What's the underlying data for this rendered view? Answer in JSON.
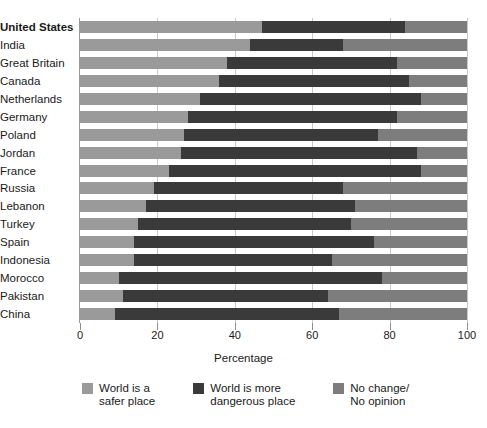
{
  "chart_data": {
    "type": "bar",
    "subtype": "horizontal-stacked-100",
    "title": "",
    "xlabel": "Percentage",
    "ylabel": "",
    "xlim": [
      0,
      100
    ],
    "xticks": [
      0,
      20,
      40,
      60,
      80,
      100
    ],
    "grid": true,
    "legend_position": "bottom-left",
    "categories": [
      "United States",
      "India",
      "Great Britain",
      "Canada",
      "Netherlands",
      "Germany",
      "Poland",
      "Jordan",
      "France",
      "Russia",
      "Lebanon",
      "Turkey",
      "Spain",
      "Indonesia",
      "Morocco",
      "Pakistan",
      "China"
    ],
    "emphasized_category": "United States",
    "series": [
      {
        "name": "World is a safer place",
        "color": "#9a9a9a",
        "values": [
          47,
          44,
          38,
          36,
          31,
          28,
          27,
          26,
          23,
          19,
          17,
          15,
          14,
          14,
          10,
          11,
          9
        ]
      },
      {
        "name": "World is more dangerous place",
        "color": "#3a3a3a",
        "values": [
          37,
          24,
          44,
          49,
          57,
          54,
          50,
          61,
          65,
          49,
          54,
          55,
          62,
          51,
          68,
          53,
          58
        ]
      },
      {
        "name": "No change/ No opinion",
        "color": "#7d7d7d",
        "values": [
          16,
          32,
          18,
          15,
          12,
          18,
          23,
          13,
          12,
          32,
          29,
          30,
          24,
          35,
          22,
          36,
          33
        ]
      }
    ]
  },
  "axis": {
    "tick_labels": [
      "0",
      "20",
      "40",
      "60",
      "80",
      "100"
    ],
    "x_title": "Percentage"
  },
  "legend": {
    "items": [
      {
        "label": "World is a\nsafer place",
        "color": "#9a9a9a",
        "swatch_name": "legend-swatch-safer"
      },
      {
        "label": "World is more\ndangerous place",
        "color": "#3a3a3a",
        "swatch_name": "legend-swatch-dangerous"
      },
      {
        "label": "No change/\nNo opinion",
        "color": "#7d7d7d",
        "swatch_name": "legend-swatch-nochange"
      }
    ]
  }
}
